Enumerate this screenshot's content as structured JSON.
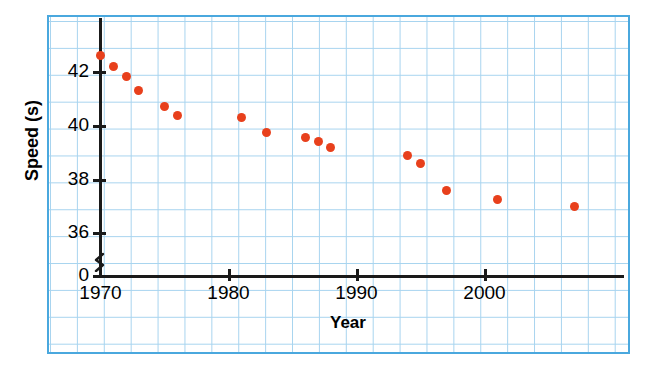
{
  "title": "",
  "chart_data": {
    "type": "scatter",
    "title": "",
    "xlabel": "Year",
    "ylabel": "Speed (s)",
    "xlim": [
      1970,
      2010
    ],
    "ylim": [
      35,
      43
    ],
    "grid": true,
    "legend": "none",
    "marker_color": "#e8401c",
    "axis_break": true,
    "x_ticks": [
      "1970",
      "1980",
      "1990",
      "2000"
    ],
    "x_tick_values": [
      1970,
      1980,
      1990,
      2000
    ],
    "y_ticks": [
      "0",
      "36",
      "38",
      "40",
      "42"
    ],
    "y_tick_values": [
      0,
      36,
      38,
      40,
      42
    ],
    "x": [
      1970,
      1971,
      1972,
      1973,
      1975,
      1976,
      1981,
      1983,
      1986,
      1987,
      1988,
      1994,
      1995,
      1997,
      2001,
      2007
    ],
    "y": [
      42.6,
      42.2,
      41.85,
      41.3,
      40.7,
      40.4,
      40.3,
      39.75,
      39.55,
      39.4,
      39.2,
      38.9,
      38.6,
      37.6,
      37.25,
      37.0
    ],
    "points": [
      {
        "x": 1970,
        "y": 42.6
      },
      {
        "x": 1971,
        "y": 42.2
      },
      {
        "x": 1972,
        "y": 41.85
      },
      {
        "x": 1973,
        "y": 41.3
      },
      {
        "x": 1975,
        "y": 40.7
      },
      {
        "x": 1976,
        "y": 40.4
      },
      {
        "x": 1981,
        "y": 40.3
      },
      {
        "x": 1983,
        "y": 39.75
      },
      {
        "x": 1986,
        "y": 39.55
      },
      {
        "x": 1987,
        "y": 39.4
      },
      {
        "x": 1988,
        "y": 39.2
      },
      {
        "x": 1994,
        "y": 38.9
      },
      {
        "x": 1995,
        "y": 38.6
      },
      {
        "x": 1997,
        "y": 37.6
      },
      {
        "x": 2001,
        "y": 37.25
      },
      {
        "x": 2007,
        "y": 37.0
      }
    ]
  },
  "colors": {
    "marker": "#e8401c",
    "grid": "#a8d4ef",
    "frame": "#4aa8de",
    "axis": "#1a1a1a"
  }
}
